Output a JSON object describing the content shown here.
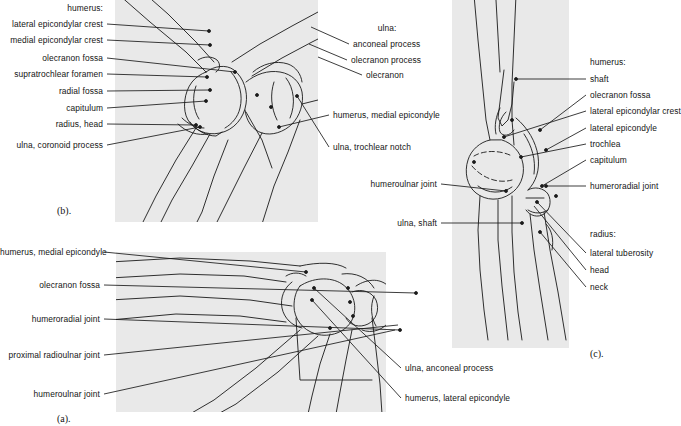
{
  "figure": {
    "panel_bg": "#e9e9e9",
    "line_color": "#1a1a1a",
    "text_color": "#141414"
  },
  "panels": [
    {
      "id": "a",
      "caption": "(a).",
      "view": "craniocaudal-extended",
      "x": 116,
      "y": 252,
      "w": 270,
      "h": 160
    },
    {
      "id": "b",
      "caption": "(b).",
      "view": "oblique-flexed",
      "x": 115,
      "y": 0,
      "w": 203,
      "h": 222
    },
    {
      "id": "c",
      "caption": "(c).",
      "view": "mediolateral",
      "x": 452,
      "y": 0,
      "w": 117,
      "h": 348
    }
  ],
  "label_groups": {
    "panel_b_left": {
      "heading": "humerus:",
      "items": [
        "lateral  epicondylar crest",
        "medial epicondylar crest",
        "olecranon fossa",
        "supratrochlear foramen",
        "radial fossa",
        "capitulum",
        "radius, head",
        "ulna, coronoid process"
      ]
    },
    "panel_b_right": {
      "heading": "ulna:",
      "items": [
        "anconeal process",
        "olecranon process",
        "olecranon",
        "humerus, medial epicondyle",
        "ulna, trochlear notch"
      ]
    },
    "panel_c_right": {
      "heading_humerus": "humerus:",
      "humerus_items": [
        "shaft",
        "olecranon fossa",
        "lateral epicondylar crest",
        "lateral epicondyle",
        "trochlea",
        "capitulum"
      ],
      "joint_item": "humeroradial joint",
      "heading_radius": "radius:",
      "radius_items": [
        "lateral tuberosity",
        "head",
        "neck"
      ]
    },
    "panel_c_left": {
      "items": [
        "humeroulnar joint",
        "ulna, shaft"
      ]
    },
    "panel_a_left": {
      "items": [
        "humerus, medial epicondyle",
        "olecranon fossa",
        "humeroradial joint",
        "proximal radioulnar joint",
        "humeroulnar joint"
      ]
    },
    "panel_a_right": {
      "items": [
        "ulna, anconeal process",
        "humerus, lateral epicondyle"
      ]
    }
  },
  "labels": [
    {
      "key": "b_l_head",
      "text": "humerus:",
      "x": 103,
      "y": 8,
      "align": "r"
    },
    {
      "key": "b_l_0",
      "text": "lateral  epicondylar crest",
      "x": 103,
      "y": 24,
      "align": "r"
    },
    {
      "key": "b_l_1",
      "text": "medial epicondylar crest",
      "x": 103,
      "y": 40,
      "align": "r"
    },
    {
      "key": "b_l_2",
      "text": "olecranon fossa",
      "x": 103,
      "y": 58,
      "align": "r"
    },
    {
      "key": "b_l_3",
      "text": "supratrochlear foramen",
      "x": 103,
      "y": 74,
      "align": "r"
    },
    {
      "key": "b_l_4",
      "text": "radial fossa",
      "x": 103,
      "y": 91,
      "align": "r"
    },
    {
      "key": "b_l_5",
      "text": "capitulum",
      "x": 103,
      "y": 108,
      "align": "r"
    },
    {
      "key": "b_l_6",
      "text": "radius, head",
      "x": 103,
      "y": 124,
      "align": "r"
    },
    {
      "key": "b_l_7",
      "text": "ulna, coronoid process",
      "x": 103,
      "y": 145,
      "align": "r"
    },
    {
      "key": "b_r_head",
      "text": "ulna:",
      "x": 387,
      "y": 28,
      "align": "c"
    },
    {
      "key": "b_r_0",
      "text": "anconeal process",
      "x": 353,
      "y": 44,
      "align": "l"
    },
    {
      "key": "b_r_1",
      "text": "olecranon process",
      "x": 351,
      "y": 60,
      "align": "l"
    },
    {
      "key": "b_r_2",
      "text": "olecranon",
      "x": 366,
      "y": 75,
      "align": "l"
    },
    {
      "key": "b_r_3",
      "text": "humerus, medial epicondyle",
      "x": 333,
      "y": 115,
      "align": "l"
    },
    {
      "key": "b_r_4",
      "text": "ulna, trochlear notch",
      "x": 333,
      "y": 147,
      "align": "l"
    },
    {
      "key": "c_r_head1",
      "text": "humerus:",
      "x": 590,
      "y": 62,
      "align": "l"
    },
    {
      "key": "c_r_0",
      "text": "shaft",
      "x": 590,
      "y": 79,
      "align": "l"
    },
    {
      "key": "c_r_1",
      "text": "olecranon fossa",
      "x": 590,
      "y": 95,
      "align": "l"
    },
    {
      "key": "c_r_2",
      "text": "lateral epicondylar crest",
      "x": 590,
      "y": 111,
      "align": "l"
    },
    {
      "key": "c_r_3",
      "text": "lateral epicondyle",
      "x": 590,
      "y": 128,
      "align": "l"
    },
    {
      "key": "c_r_4",
      "text": "trochlea",
      "x": 590,
      "y": 144,
      "align": "l"
    },
    {
      "key": "c_r_5",
      "text": "capitulum",
      "x": 590,
      "y": 160,
      "align": "l"
    },
    {
      "key": "c_r_6",
      "text": "humeroradial joint",
      "x": 590,
      "y": 186,
      "align": "l"
    },
    {
      "key": "c_r_head2",
      "text": "radius:",
      "x": 590,
      "y": 234,
      "align": "l"
    },
    {
      "key": "c_r_7",
      "text": "lateral tuberosity",
      "x": 590,
      "y": 253,
      "align": "l"
    },
    {
      "key": "c_r_8",
      "text": "head",
      "x": 590,
      "y": 270,
      "align": "l"
    },
    {
      "key": "c_r_9",
      "text": "neck",
      "x": 590,
      "y": 287,
      "align": "l"
    },
    {
      "key": "c_l_0",
      "text": "humeroulnar joint",
      "x": 437,
      "y": 184,
      "align": "r"
    },
    {
      "key": "c_l_1",
      "text": "ulna, shaft",
      "x": 437,
      "y": 223,
      "align": "r"
    },
    {
      "key": "a_l_0",
      "text": "humerus, medial epicondyle",
      "x": 100,
      "y": 252,
      "align": "r"
    },
    {
      "key": "a_l_1",
      "text": "olecranon fossa",
      "x": 100,
      "y": 285,
      "align": "r"
    },
    {
      "key": "a_l_2",
      "text": "humeroradial joint",
      "x": 100,
      "y": 319,
      "align": "r"
    },
    {
      "key": "a_l_3",
      "text": "proximal radioulnar joint",
      "x": 100,
      "y": 355,
      "align": "r"
    },
    {
      "key": "a_l_4",
      "text": "humeroulnar joint",
      "x": 100,
      "y": 394,
      "align": "r"
    },
    {
      "key": "a_r_0",
      "text": "ulna, anconeal process",
      "x": 405,
      "y": 368,
      "align": "l"
    },
    {
      "key": "a_r_1",
      "text": "humerus, lateral epicondyle",
      "x": 405,
      "y": 398,
      "align": "l"
    }
  ],
  "captions": [
    {
      "key": "cap_b",
      "text": "(b).",
      "x": 57,
      "y": 205
    },
    {
      "key": "cap_c",
      "text": "(c).",
      "x": 590,
      "y": 348
    },
    {
      "key": "cap_a",
      "text": "(a).",
      "x": 57,
      "y": 413
    }
  ]
}
